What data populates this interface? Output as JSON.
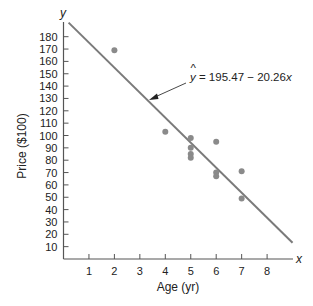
{
  "chart_data": {
    "type": "scatter",
    "title": "",
    "xlabel": "Age (yr)",
    "ylabel": "Price ($100)",
    "x_axis_var": "x",
    "y_axis_var": "y",
    "xlim": [
      0,
      9
    ],
    "ylim": [
      0,
      190
    ],
    "x_ticks": [
      1,
      2,
      3,
      4,
      5,
      6,
      7,
      8
    ],
    "y_ticks": [
      10,
      20,
      30,
      40,
      50,
      60,
      70,
      80,
      90,
      100,
      110,
      120,
      130,
      140,
      150,
      160,
      170,
      180
    ],
    "grid": false,
    "legend": null,
    "points": [
      {
        "x": 2,
        "y": 169
      },
      {
        "x": 4,
        "y": 103
      },
      {
        "x": 5,
        "y": 98
      },
      {
        "x": 5,
        "y": 90
      },
      {
        "x": 5,
        "y": 85
      },
      {
        "x": 5,
        "y": 82
      },
      {
        "x": 6,
        "y": 95
      },
      {
        "x": 6,
        "y": 70
      },
      {
        "x": 6,
        "y": 67
      },
      {
        "x": 7,
        "y": 71
      },
      {
        "x": 7,
        "y": 49
      }
    ],
    "regression_line": {
      "intercept": 195.47,
      "slope": -20.26,
      "x_range": [
        0.2,
        9.0
      ]
    },
    "annotations": [
      {
        "text_hat": "y",
        "text_rest": " = 195.47 − 20.26",
        "text_var": "x",
        "full_text": "ŷ = 195.47 − 20.26x",
        "arrow_to": "regression-line"
      }
    ],
    "colors": {
      "points": "#8a8a8a",
      "line": "#7a7a7a",
      "axis": "#555555",
      "text": "#222222"
    }
  }
}
